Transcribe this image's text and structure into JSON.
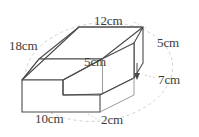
{
  "figure": {
    "shape_name": "l-shaped-step-prism",
    "projection": "oblique",
    "background_color": "#ffffff",
    "outline_color": "#4a4a4a",
    "hidden_guide_color": "#c9c9c9",
    "label_color": "#3c3c3c",
    "labels": {
      "back_left_depth": "18cm",
      "top_back_width": "12cm",
      "right_height": "5cm",
      "inner_step_height": "5cm",
      "right_depth": "7cm",
      "front_bottom_width": "10cm",
      "front_step_depth": "2cm"
    }
  }
}
